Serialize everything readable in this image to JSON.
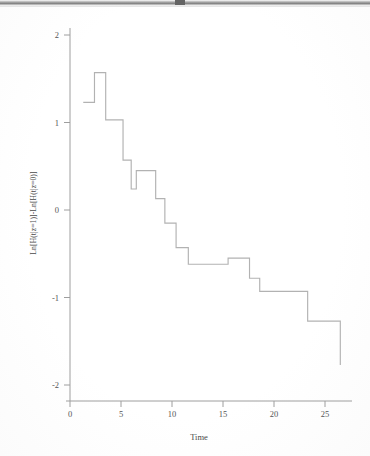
{
  "figure": {
    "title": "",
    "background_color": "#ffffff",
    "line_color": "#b2b2b2",
    "axis_color": "#9e9e9e"
  },
  "chart_data": {
    "type": "line",
    "subtype": "step",
    "title": "",
    "xlabel": "Time",
    "ylabel": "Ln[H(t|z=1)]-Ln[H(t|z=0)]",
    "xlim": [
      -0.7,
      27.5
    ],
    "ylim": [
      -2.15,
      2.25
    ],
    "xticks": [
      0,
      5,
      10,
      15,
      20,
      25
    ],
    "xticklabels": [
      "0",
      "5",
      "10",
      "15",
      "20",
      "25"
    ],
    "yticks": [
      2,
      1,
      0,
      -1,
      -2
    ],
    "yticklabels": [
      "2",
      "1",
      "0",
      "-1",
      "-2"
    ],
    "grid": false,
    "legend": null,
    "series": [
      {
        "name": "Ln[H(t|z=1)]-Ln[H(t|z=0)]",
        "color": "#b2b2b2",
        "step_mode": "post",
        "x": [
          1.3,
          2.4,
          3.5,
          5.2,
          6.0,
          6.5,
          8.4,
          9.3,
          10.4,
          11.1,
          11.6,
          15.5,
          16.4,
          17.6,
          18.6,
          23.3,
          26.4,
          26.5
        ],
        "y": [
          1.23,
          1.57,
          1.03,
          0.57,
          0.24,
          0.45,
          0.13,
          -0.15,
          -0.43,
          -0.43,
          -0.62,
          -0.55,
          -0.55,
          -0.78,
          -0.93,
          -1.27,
          -1.27,
          -1.77
        ],
        "points": [
          {
            "t": 1.3,
            "value": 1.23
          },
          {
            "t": 2.4,
            "value": 1.57
          },
          {
            "t": 3.5,
            "value": 1.03
          },
          {
            "t": 5.2,
            "value": 0.57
          },
          {
            "t": 6.0,
            "value": 0.24
          },
          {
            "t": 6.5,
            "value": 0.45
          },
          {
            "t": 8.4,
            "value": 0.13
          },
          {
            "t": 9.3,
            "value": -0.15
          },
          {
            "t": 10.4,
            "value": -0.43
          },
          {
            "t": 11.6,
            "value": -0.62
          },
          {
            "t": 15.5,
            "value": -0.55
          },
          {
            "t": 16.4,
            "value": -0.78
          },
          {
            "t": 18.6,
            "value": -0.93
          },
          {
            "t": 23.3,
            "value": -1.27
          },
          {
            "t": 26.5,
            "value": -1.77
          }
        ]
      }
    ]
  }
}
